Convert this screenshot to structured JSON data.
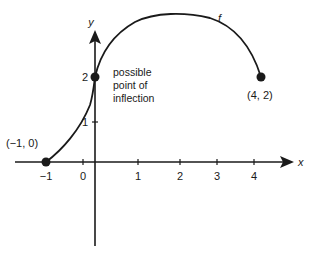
{
  "figure": {
    "function_label": "f",
    "x_axis_label": "x",
    "y_axis_label": "y",
    "x_ticks": [
      "−1",
      "0",
      "1",
      "2",
      "3",
      "4"
    ],
    "y_ticks": [
      "1",
      "2"
    ],
    "points": [
      {
        "label": "(−1, 0)",
        "x": -1,
        "y": 0
      },
      {
        "label": "(4, 2)",
        "x": 4,
        "y": 2
      },
      {
        "label": "",
        "x": 0,
        "y": 2
      }
    ],
    "annotation": {
      "line1": "possible",
      "line2": "point of",
      "line3": "inflection"
    },
    "colors": {
      "ink": "#1a1a1a",
      "background": "#ffffff"
    }
  }
}
